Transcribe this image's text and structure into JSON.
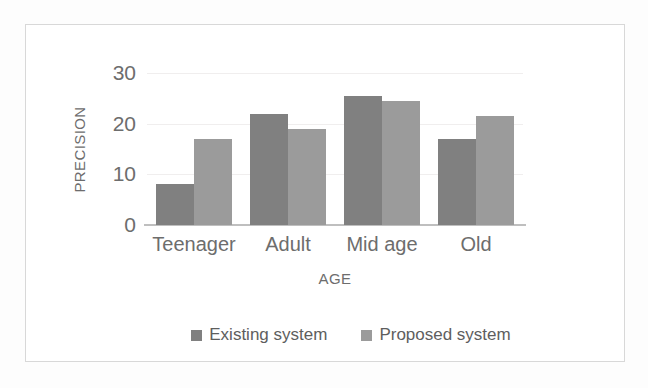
{
  "chart_data": {
    "type": "bar",
    "title": "",
    "xlabel": "AGE",
    "ylabel": "PRECISION",
    "categories": [
      "Teenager",
      "Adult",
      "Mid age",
      "Old"
    ],
    "series": [
      {
        "name": "Existing system",
        "color": "#808080",
        "values": [
          8,
          22,
          25.5,
          17
        ]
      },
      {
        "name": "Proposed system",
        "color": "#9b9b9b",
        "values": [
          17,
          19,
          24.5,
          21.5
        ]
      }
    ],
    "ylim": [
      0,
      30
    ],
    "yticks": [
      0,
      10,
      20,
      30
    ],
    "ytick_labels": [
      "0",
      "10",
      "20",
      "30"
    ],
    "grid": true,
    "legend_position": "bottom"
  },
  "legend": {
    "entries": [
      {
        "label": "Existing system",
        "swatch": "#808080"
      },
      {
        "label": "Proposed system",
        "swatch": "#9b9b9b"
      }
    ]
  },
  "axes": {
    "y_title": "PRECISION",
    "x_title": "AGE"
  }
}
